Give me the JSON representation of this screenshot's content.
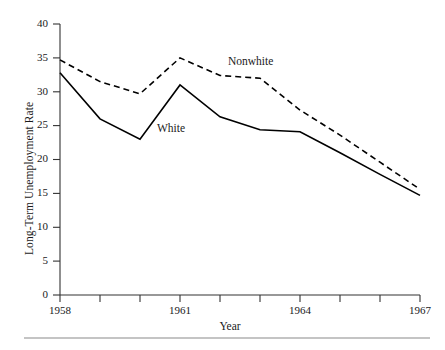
{
  "chart_data": {
    "type": "line",
    "title": "",
    "xlabel": "Year",
    "ylabel": "Long-Term Unemployment Rate",
    "xlim": [
      1958,
      1967
    ],
    "ylim": [
      0,
      40
    ],
    "x": [
      1958,
      1959,
      1960,
      1961,
      1962,
      1963,
      1964,
      1965,
      1966,
      1967
    ],
    "xtick_labels": [
      "1958",
      "",
      "",
      "1961",
      "",
      "",
      "1964",
      "",
      "",
      "1967"
    ],
    "xticks_major": [
      "1958",
      "1961",
      "1964",
      "1967"
    ],
    "yticks": [
      0,
      5,
      10,
      15,
      20,
      25,
      30,
      35,
      40
    ],
    "ytick_labels": [
      "0",
      "5",
      "10",
      "15",
      "20",
      "25",
      "30",
      "35",
      "40"
    ],
    "grid": false,
    "legend_position": "inline-annotations",
    "series": [
      {
        "name": "White",
        "style": "solid",
        "color": "#000000",
        "label_annotation": "White",
        "values": [
          32.8,
          26.0,
          23.0,
          31.0,
          26.3,
          24.4,
          24.1,
          21.0,
          17.8,
          14.7
        ]
      },
      {
        "name": "Nonwhite",
        "style": "dashed",
        "color": "#000000",
        "label_annotation": "Nonwhite",
        "values": [
          34.7,
          31.5,
          29.7,
          35.0,
          32.4,
          32.0,
          27.3,
          23.6,
          19.6,
          15.6
        ]
      }
    ],
    "annotations": [
      {
        "text": "White",
        "x": 1960.5,
        "y": 25.0
      },
      {
        "text": "Nonwhite",
        "x": 1962.3,
        "y": 35.5
      }
    ]
  },
  "figure": {
    "axis_color": "#333333",
    "rule_color": "#808080"
  }
}
